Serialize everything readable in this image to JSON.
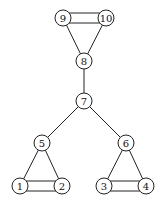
{
  "graph": {
    "nodes": [
      {
        "id": "1",
        "label": "1",
        "x": 20,
        "y": 186
      },
      {
        "id": "2",
        "label": "2",
        "x": 62,
        "y": 186
      },
      {
        "id": "3",
        "label": "3",
        "x": 104,
        "y": 186
      },
      {
        "id": "4",
        "label": "4",
        "x": 146,
        "y": 186
      },
      {
        "id": "5",
        "label": "5",
        "x": 42,
        "y": 143
      },
      {
        "id": "6",
        "label": "6",
        "x": 126,
        "y": 143
      },
      {
        "id": "7",
        "label": "7",
        "x": 84,
        "y": 101
      },
      {
        "id": "8",
        "label": "8",
        "x": 84,
        "y": 61
      },
      {
        "id": "9",
        "label": "9",
        "x": 63,
        "y": 18
      },
      {
        "id": "10",
        "label": "10",
        "x": 106,
        "y": 18
      }
    ],
    "edges": [
      {
        "from": "9",
        "to": "10",
        "double": true
      },
      {
        "from": "9",
        "to": "8",
        "double": false
      },
      {
        "from": "10",
        "to": "8",
        "double": false
      },
      {
        "from": "8",
        "to": "7",
        "double": false
      },
      {
        "from": "7",
        "to": "5",
        "double": false
      },
      {
        "from": "7",
        "to": "6",
        "double": false
      },
      {
        "from": "5",
        "to": "1",
        "double": false
      },
      {
        "from": "5",
        "to": "2",
        "double": false
      },
      {
        "from": "1",
        "to": "2",
        "double": true
      },
      {
        "from": "6",
        "to": "3",
        "double": false
      },
      {
        "from": "6",
        "to": "4",
        "double": false
      },
      {
        "from": "3",
        "to": "4",
        "double": true
      }
    ]
  }
}
